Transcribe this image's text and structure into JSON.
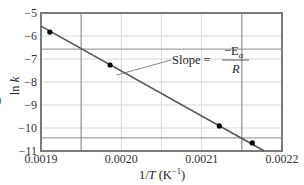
{
  "chart_data": {
    "type": "scatter",
    "title": "",
    "xlabel": "1/T (K⁻¹)",
    "xlabel_parts": {
      "pre": "1/",
      "var": "T",
      "unit": " (K",
      "sup": "−1",
      "close": ")"
    },
    "ylabel": "ln k",
    "ylabel_parts": {
      "fn": "ln ",
      "var": "k"
    },
    "xlim": [
      0.0019,
      0.0022
    ],
    "ylim": [
      -11,
      -5
    ],
    "x_ticks": [
      0.0019,
      0.002,
      0.0021,
      0.0022
    ],
    "x_tick_labels": [
      "0.0019",
      "0.0020",
      "0.0021",
      "0.0022"
    ],
    "y_ticks": [
      -5,
      -6,
      -7,
      -8,
      -9,
      -10,
      -11
    ],
    "y_tick_labels": [
      "−5",
      "−6",
      "−7",
      "−8",
      "−9",
      "−10",
      "−11"
    ],
    "grid": true,
    "x_minor_grid": [
      0.00195,
      0.002,
      0.00205,
      0.0021,
      0.00215
    ],
    "series": [
      {
        "name": "data",
        "x": [
          0.001911,
          0.001986,
          0.002122,
          0.002163
        ],
        "y": [
          -5.83,
          -7.26,
          -9.91,
          -10.65
        ],
        "marker": "circle",
        "color": "#000000"
      }
    ],
    "fit_line": {
      "x": [
        0.0019,
        0.002178
      ],
      "y": [
        -5.57,
        -11.0
      ],
      "color": "#555555"
    },
    "reference_lines": {
      "vertical": [
        0.00195,
        0.00215
      ],
      "horizontal": [
        -6.57,
        -10.43
      ]
    },
    "annotation": {
      "text": "Slope = −Ea/R",
      "lead": "Slope =",
      "numerator": "−E",
      "numerator_sub": "a",
      "denominator": "R",
      "points_to": [
        0.001994,
        -7.7
      ]
    },
    "legend": null
  },
  "colors": {
    "frame": "#7a7a7a",
    "grid": "#d8d8d8",
    "reference": "#8a8a8a",
    "line": "#555555",
    "marker": "#000000"
  },
  "fragment": {
    "text": ")"
  }
}
